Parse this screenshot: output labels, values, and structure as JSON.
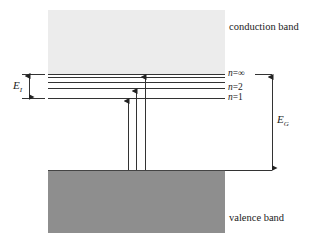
{
  "diagram": {
    "type": "energy-band-diagram",
    "bands": {
      "conduction": {
        "label": "conduction band",
        "color": "#ececec"
      },
      "valence": {
        "label": "valence band",
        "color": "#8e8e8e"
      }
    },
    "levels": [
      {
        "name": "n=∞",
        "label_prefix": "n",
        "label_suffix": "=∞"
      },
      {
        "name": "n=2",
        "label_prefix": "n",
        "label_suffix": "=2"
      },
      {
        "name": "n=1",
        "label_prefix": "n",
        "label_suffix": "=1"
      }
    ],
    "annotations": {
      "ionization_energy": {
        "symbol": "E",
        "subscript": "I"
      },
      "band_gap": {
        "symbol": "E",
        "subscript": "G"
      }
    },
    "transitions": [
      {
        "from": "valence band",
        "to": "n=1"
      },
      {
        "from": "valence band",
        "to": "n=2"
      },
      {
        "from": "valence band",
        "to": "n=∞"
      }
    ],
    "line_color": "#333333"
  }
}
